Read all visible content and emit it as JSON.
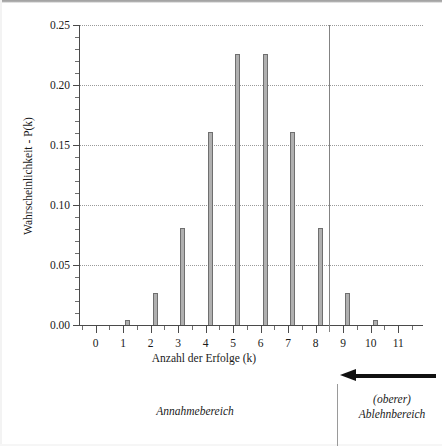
{
  "chart_data": {
    "type": "bar",
    "title": "",
    "subtitle": "",
    "xlabel": "Anzahl der Erfolge (k)",
    "ylabel": "Wahrscheinlichkeit - P(k)",
    "categories": [
      "0",
      "1",
      "2",
      "3",
      "4",
      "5",
      "6",
      "7",
      "8",
      "9",
      "10",
      "11"
    ],
    "values": [
      0.0,
      0.004,
      0.027,
      0.081,
      0.161,
      0.226,
      0.226,
      0.161,
      0.081,
      0.027,
      0.004,
      0.0
    ],
    "ylim": [
      0.0,
      0.25
    ],
    "xlim": [
      -0.6,
      11.9
    ],
    "y_ticks": [
      "0.00",
      "0.05",
      "0.10",
      "0.15",
      "0.20",
      "0.25"
    ],
    "y_tick_values": [
      0.0,
      0.05,
      0.1,
      0.15,
      0.2,
      0.25
    ],
    "y_minor_step": 0.01,
    "x_ticks": [
      "0",
      "1",
      "2",
      "3",
      "4",
      "5",
      "6",
      "7",
      "8",
      "9",
      "10",
      "11"
    ],
    "grid": "horizontal-dotted",
    "legend": "none",
    "bar_color": "#b0b0b0",
    "bar_edge_color": "#6f6f6f",
    "annotations": [
      {
        "name": "region-divider",
        "kind": "vertical-line",
        "x_value": 8.5,
        "color": "#838383"
      },
      {
        "name": "rejection-arrow",
        "kind": "arrow",
        "direction": "left",
        "color": "#111111"
      }
    ]
  },
  "axes": {
    "y_title": "Wahrscheinlichkeit - P(k)",
    "x_title": "Anzahl der Erfolge (k)"
  },
  "regions": {
    "acceptance_label": "Annahmebereich",
    "rejection_label_line1": "(oberer)",
    "rejection_label_line2": "Ablehnbereich"
  },
  "colors": {
    "bar_fill": "#b0b0b0",
    "bar_edge": "#6f6f6f",
    "axis": "#4a4a4a",
    "grid": "#9a9a9a",
    "divider": "#838383",
    "arrow": "#111111",
    "text": "#1a1a1a",
    "background": "#ffffff"
  }
}
